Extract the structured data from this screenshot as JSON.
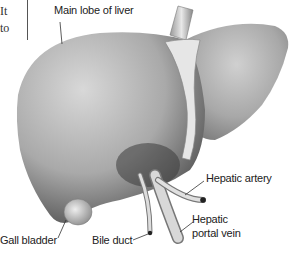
{
  "side_text": {
    "line1": "It",
    "line2": "to"
  },
  "labels": {
    "main_lobe": "Main lobe of liver",
    "hepatic_artery": "Hepatic artery",
    "hepatic_portal_vein_1": "Hepatic",
    "hepatic_portal_vein_2": "portal vein",
    "gall_bladder": "Gall bladder",
    "bile_duct": "Bile duct"
  }
}
